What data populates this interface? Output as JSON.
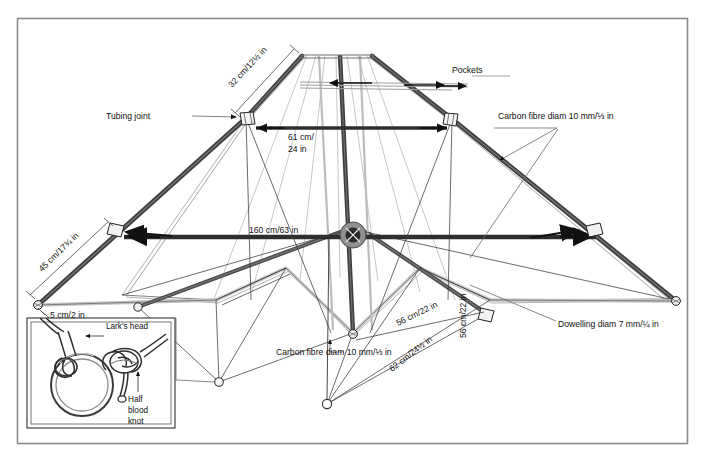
{
  "figure": {
    "kind": "technical-line-drawing",
    "border_color": "#7a7a7a",
    "line_color": "#111111",
    "spar_dark_color": "#3b3b3b",
    "spar_mid_color": "#8c8c8c",
    "spar_light_color": "#c9c9c9",
    "background_color": "#ffffff"
  },
  "callouts": {
    "tubing_joint": "Tubing joint",
    "pockets": "Pockets",
    "carbon_fibre_right": "Carbon fibre diam 10 mm/⅓ in",
    "carbon_fibre_bottom": "Carbon fibre diam 10 mm/⅓ in",
    "dowelling": "Dowelling diam 7 mm/¼ in"
  },
  "dimensions": {
    "top_leading_edge": "32 cm/12½ in",
    "spreader_top": "61 cm/\n24 in",
    "spreader_top_line1": "61 cm/",
    "spreader_top_line2": "24 in",
    "left_lower_leading_edge": "45 cm/17¾ in",
    "left_tip_tail": "5 cm/2 in",
    "main_spreader": "160 cm/63 in",
    "left_lower_spar": "56 cm/22 in",
    "keel_vertical": "56 cm/22 in",
    "right_lower_spar": "62 cm/24½ in"
  },
  "inset": {
    "title_knot_1": "Lark's head",
    "title_knot_2": "Half\nblood\nknot",
    "knot2_line1": "Half",
    "knot2_line2": "blood",
    "knot2_line3": "knot",
    "ring_label": "split ring"
  }
}
